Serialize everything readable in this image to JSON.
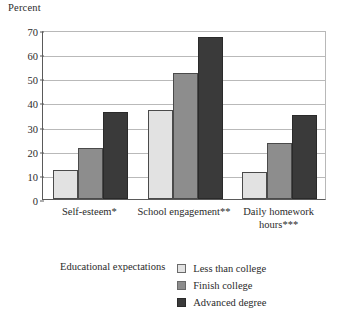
{
  "chart_data": {
    "type": "bar",
    "title": "",
    "xlabel": "",
    "ylabel": "Percent",
    "ylim": [
      0,
      70
    ],
    "yticks": [
      0,
      10,
      20,
      30,
      40,
      50,
      60,
      70
    ],
    "grid": true,
    "legend_position": "bottom",
    "legend_title": "Educational expectations",
    "categories": [
      "Self-esteem*",
      "School engagement**",
      "Daily homework\nhours***"
    ],
    "series": [
      {
        "name": "Less than college",
        "color": "#e2e2e2",
        "values": [
          12,
          37,
          11
        ]
      },
      {
        "name": "Finish college",
        "color": "#8d8d8d",
        "values": [
          21,
          52,
          23
        ]
      },
      {
        "name": "Advanced degree",
        "color": "#3a3a3a",
        "values": [
          36,
          67,
          35
        ]
      }
    ]
  }
}
